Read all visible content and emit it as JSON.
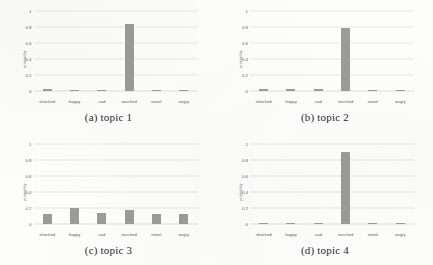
{
  "figure": {
    "categories": [
      "shocked",
      "happy",
      "sad",
      "touched",
      "novel",
      "angry"
    ],
    "yticks": [
      "1",
      "0.8",
      "0.6",
      "0.4",
      "0.2",
      "0"
    ],
    "ylabel": "probability",
    "bar_color": "#9b9b9b",
    "gridline_color": "#e8e8e6"
  },
  "chart_data": [
    {
      "type": "bar",
      "title": "(a) topic 1",
      "categories": [
        "shocked",
        "happy",
        "sad",
        "touched",
        "novel",
        "angry"
      ],
      "values": [
        0.02,
        0.015,
        0.005,
        0.84,
        0.01,
        0.008
      ],
      "xlabel": "",
      "ylabel": "probability",
      "ylim": [
        0,
        1
      ],
      "ytick_values": [
        0,
        0.2,
        0.4,
        0.6,
        0.8,
        1
      ],
      "grid": true,
      "legend": "none"
    },
    {
      "type": "bar",
      "title": "(b) topic 2",
      "categories": [
        "shocked",
        "happy",
        "sad",
        "touched",
        "novel",
        "angry"
      ],
      "values": [
        0.022,
        0.022,
        0.02,
        0.79,
        0.006,
        0.006
      ],
      "xlabel": "",
      "ylabel": "probability",
      "ylim": [
        0,
        1
      ],
      "ytick_values": [
        0,
        0.2,
        0.4,
        0.6,
        0.8,
        1
      ],
      "grid": true,
      "legend": "none"
    },
    {
      "type": "bar",
      "title": "(c) topic 3",
      "categories": [
        "shocked",
        "happy",
        "sad",
        "touched",
        "novel",
        "angry"
      ],
      "values": [
        0.13,
        0.2,
        0.14,
        0.17,
        0.12,
        0.13
      ],
      "xlabel": "",
      "ylabel": "probability",
      "ylim": [
        0,
        1
      ],
      "ytick_values": [
        0,
        0.2,
        0.4,
        0.6,
        0.8,
        1
      ],
      "grid": true,
      "legend": "none"
    },
    {
      "type": "bar",
      "title": "(d) topic 4",
      "categories": [
        "shocked",
        "happy",
        "sad",
        "touched",
        "novel",
        "angry"
      ],
      "values": [
        0.012,
        0.012,
        0.008,
        0.9,
        0.008,
        0.012
      ],
      "xlabel": "",
      "ylabel": "probability",
      "ylim": [
        0,
        1
      ],
      "ytick_values": [
        0,
        0.2,
        0.4,
        0.6,
        0.8,
        1
      ],
      "grid": true,
      "legend": "none"
    }
  ]
}
